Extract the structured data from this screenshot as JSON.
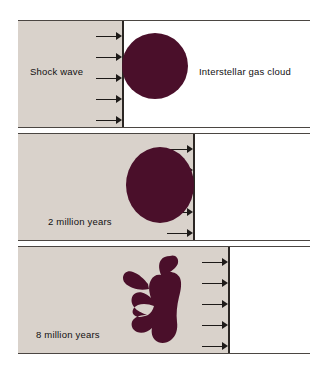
{
  "figure": {
    "background_color": "#ffffff",
    "shocked_region_color": "#d9d2cb",
    "cloud_color": "#4a0f2a",
    "front_line_color": "#2c2724",
    "rule_color": "#4b4642",
    "arrow_color": "#1d1a18"
  },
  "panels": [
    {
      "id": "panel-initial",
      "labels": {
        "left": "Shock wave",
        "right": "Interstellar gas cloud"
      },
      "shock_front_x": 122,
      "arrow_count": 5,
      "cloud_shape": "circle"
    },
    {
      "id": "panel-2-million-years",
      "labels": {
        "time": "2 million years"
      },
      "shock_front_x": 193,
      "arrow_count": 5,
      "cloud_shape": "ellipse"
    },
    {
      "id": "panel-8-million-years",
      "labels": {
        "time": "8 million years"
      },
      "shock_front_x": 228,
      "arrow_count": 5,
      "cloud_shape": "fragmented-blob"
    }
  ]
}
